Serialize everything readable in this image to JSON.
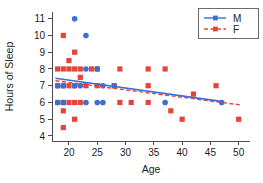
{
  "chart_data": {
    "type": "scatter",
    "title": "",
    "xlabel": "Age",
    "ylabel": "Hours of Sleep",
    "xlim": [
      17,
      52
    ],
    "ylim": [
      3.7,
      11.4
    ],
    "xticks": [
      20,
      25,
      30,
      35,
      40,
      45,
      50
    ],
    "yticks": [
      4,
      5,
      6,
      7,
      8,
      9,
      10,
      11
    ],
    "grid": false,
    "legend_position": "top-right",
    "series": [
      {
        "name": "M",
        "color": "#3a6fd8",
        "marker": "circle",
        "linestyle": "solid",
        "points": [
          [
            21,
            11
          ],
          [
            23,
            10
          ],
          [
            23,
            8
          ],
          [
            25,
            8
          ],
          [
            18,
            7
          ],
          [
            19,
            7
          ],
          [
            21,
            7
          ],
          [
            22,
            7
          ],
          [
            26,
            7
          ],
          [
            28,
            7
          ],
          [
            18,
            6
          ],
          [
            19,
            6
          ],
          [
            23,
            6
          ],
          [
            25,
            6
          ],
          [
            26,
            6
          ],
          [
            37,
            6
          ],
          [
            47,
            6
          ]
        ],
        "trendline": {
          "x_start": 17.6,
          "y_start": 7.45,
          "x_end": 47.2,
          "y_end": 6.05
        }
      },
      {
        "name": "F",
        "color": "#e8433a",
        "marker": "square",
        "linestyle": "dashed",
        "points": [
          [
            19,
            10
          ],
          [
            21,
            9
          ],
          [
            20,
            8.5
          ],
          [
            18,
            8
          ],
          [
            19,
            8
          ],
          [
            20,
            8
          ],
          [
            21,
            8
          ],
          [
            22,
            8
          ],
          [
            24,
            8
          ],
          [
            25,
            8
          ],
          [
            29,
            8
          ],
          [
            34,
            8
          ],
          [
            37,
            8
          ],
          [
            22,
            7.5
          ],
          [
            18,
            7
          ],
          [
            19,
            7
          ],
          [
            20,
            7
          ],
          [
            21,
            7
          ],
          [
            23,
            7
          ],
          [
            25,
            7
          ],
          [
            28,
            7
          ],
          [
            34,
            7
          ],
          [
            42,
            6.5
          ],
          [
            46,
            7
          ],
          [
            18,
            6
          ],
          [
            19,
            6
          ],
          [
            20,
            6
          ],
          [
            21,
            6
          ],
          [
            22,
            6
          ],
          [
            29,
            6
          ],
          [
            31,
            6
          ],
          [
            34,
            6
          ],
          [
            19,
            5.5
          ],
          [
            38,
            5.5
          ],
          [
            21,
            5
          ],
          [
            40,
            5
          ],
          [
            50,
            5
          ],
          [
            19,
            4.5
          ]
        ],
        "trendline": {
          "x_start": 17.6,
          "y_start": 7.3,
          "x_end": 50.4,
          "y_end": 5.85
        }
      }
    ]
  },
  "legend": {
    "entries": [
      {
        "label": "M"
      },
      {
        "label": "F"
      }
    ]
  },
  "axes": {
    "x_title": "Age",
    "y_title": "Hours of Sleep",
    "x_tick_labels": [
      "20",
      "25",
      "30",
      "35",
      "40",
      "45",
      "50"
    ],
    "y_tick_labels": [
      "4",
      "5",
      "6",
      "7",
      "8",
      "9",
      "10",
      "11"
    ]
  },
  "colors": {
    "male": "#3a6fd8",
    "female": "#e8433a",
    "axis": "#4d4d4d",
    "text": "#1b1b1b",
    "background": "#ffffff"
  }
}
